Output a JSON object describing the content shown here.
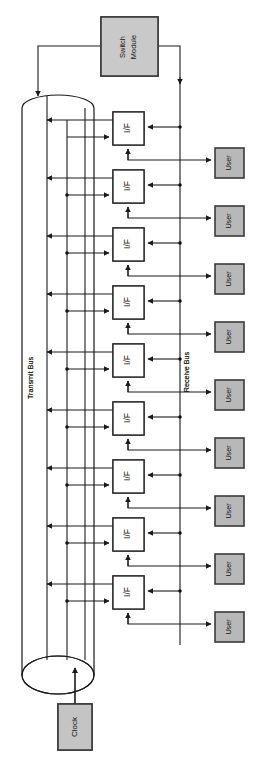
{
  "figure": {
    "type": "block-diagram",
    "orientation": "rotated-90-counterclockwise",
    "background_color": "#ffffff"
  },
  "switch_module": {
    "label_line1": "Switch",
    "label_line2": "Module",
    "fill": "#c9c9c9"
  },
  "buses": {
    "transmit": {
      "label": "Transmit Bus",
      "shape": "cylinder"
    },
    "receive": {
      "label": "Receive Bus",
      "shape": "line"
    }
  },
  "clock": {
    "label": "Clock",
    "fill": "#c4c4c4"
  },
  "interfaces": [
    {
      "label": "I/F"
    },
    {
      "label": "I/F"
    },
    {
      "label": "I/F"
    },
    {
      "label": "I/F"
    },
    {
      "label": "I/F"
    },
    {
      "label": "I/F"
    },
    {
      "label": "I/F"
    },
    {
      "label": "I/F"
    },
    {
      "label": "I/F"
    }
  ],
  "users": [
    {
      "label": "User"
    },
    {
      "label": "User"
    },
    {
      "label": "User"
    },
    {
      "label": "User"
    },
    {
      "label": "User"
    },
    {
      "label": "User"
    },
    {
      "label": "User"
    },
    {
      "label": "User"
    },
    {
      "label": "User"
    }
  ],
  "colors": {
    "line": "#1a1a1a",
    "switch_fill": "#c9c9c9",
    "user_fill": "#b8b8b8",
    "clock_fill": "#c4c4c4",
    "if_fill": "#ffffff"
  }
}
